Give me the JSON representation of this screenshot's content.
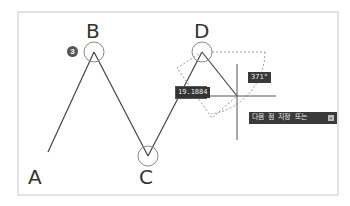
{
  "points": [
    {
      "label": "A"
    },
    {
      "label": "B"
    },
    {
      "label": "C"
    },
    {
      "label": "D"
    }
  ],
  "step_badge": "3",
  "distance_input": {
    "value": "19.1884"
  },
  "angle_tooltip": "371°",
  "prompt_tooltip": "다음 점 지정 또는",
  "prompt_icon": "arrow-down-icon",
  "colors": {
    "frame": "#c8c8c8",
    "line": "#444444",
    "circle": "#888888",
    "tooltip_bg": "#3a3a3a"
  }
}
